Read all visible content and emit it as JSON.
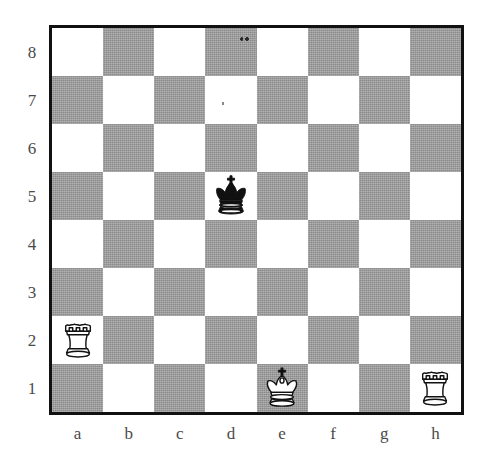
{
  "diagram": {
    "board_size": 8,
    "colors": {
      "light_square": "#ffffff",
      "dark_square": "#9b9b9b",
      "border": "#111111",
      "label_text": "#4a4a4a",
      "black_piece": "#111111",
      "white_piece": "#ffffff"
    },
    "orientation": "white-bottom"
  },
  "files": [
    "a",
    "b",
    "c",
    "d",
    "e",
    "f",
    "g",
    "h"
  ],
  "ranks": [
    "8",
    "7",
    "6",
    "5",
    "4",
    "3",
    "2",
    "1"
  ],
  "pieces": [
    {
      "square": "d5",
      "color": "black",
      "type": "king",
      "glyph": "black-king",
      "label": "Black king on d5"
    },
    {
      "square": "a2",
      "color": "white",
      "type": "rook",
      "glyph": "white-rook",
      "label": "White rook on a2"
    },
    {
      "square": "e1",
      "color": "white",
      "type": "king",
      "glyph": "white-king",
      "label": "White king on e1"
    },
    {
      "square": "h1",
      "color": "white",
      "type": "rook",
      "glyph": "white-rook",
      "label": "White rook on h1"
    }
  ],
  "fen": "8/8/8/3k4/8/8/R7/4K2R",
  "artifacts": [
    {
      "square": "d8",
      "kind": "scan-speck"
    },
    {
      "square": "d7",
      "kind": "scan-speck"
    }
  ]
}
